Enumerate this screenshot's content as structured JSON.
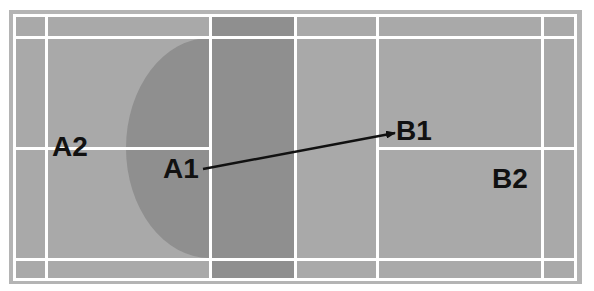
{
  "diagram": {
    "type": "badminton-court-shot-diagram",
    "colors": {
      "court_light": "#a9a9a9",
      "court_dark": "#8f8f8f",
      "court_border": "#b4b4b4",
      "lines": "#ffffff",
      "arrow": "#111111",
      "text": "#111111"
    },
    "labels": {
      "a2": "A2",
      "a1": "A1",
      "b1": "B1",
      "b2": "B2"
    },
    "arrow": {
      "from": "A1",
      "to": "B1"
    },
    "shaded_zone": "half-ellipse plus column in front of net on A side"
  }
}
